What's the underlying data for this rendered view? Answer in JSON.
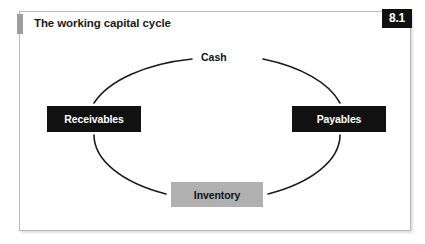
{
  "figure": {
    "title": "The working capital cycle",
    "number": "8.1",
    "accent_color": "#9e9e9e",
    "badge_background": "#111111",
    "badge_text_color": "#ffffff",
    "border_color": "#b9b9b9"
  },
  "diagram": {
    "type": "cycle",
    "nodes": [
      {
        "id": "cash",
        "label": "Cash",
        "style": "plain",
        "background": "#ffffff",
        "text_color": "#111111"
      },
      {
        "id": "payables",
        "label": "Payables",
        "style": "dark",
        "background": "#111111",
        "text_color": "#ffffff"
      },
      {
        "id": "inventory",
        "label": "Inventory",
        "style": "gray",
        "background": "#b0b0b0",
        "text_color": "#111111"
      },
      {
        "id": "receivables",
        "label": "Receivables",
        "style": "dark",
        "background": "#111111",
        "text_color": "#ffffff"
      }
    ],
    "connector_color": "#1b1b1b",
    "connector_shape": "ellipse-arcs"
  }
}
